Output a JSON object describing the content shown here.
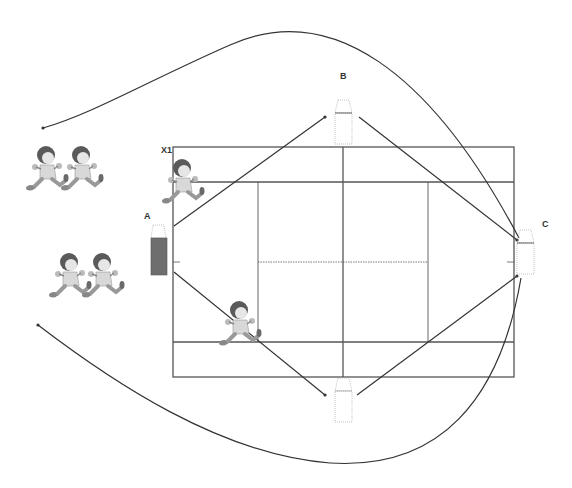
{
  "diagram": {
    "type": "badminton-court-drill",
    "labels": {
      "x1": "X1",
      "a": "A",
      "b": "B",
      "c": "C"
    },
    "colors": {
      "line": "#333333",
      "court_line": "#555555",
      "cone_outline": "#999999",
      "cone_fill_active": "#6e6e6e",
      "player_hair": "#555555",
      "player_body": "#cfcfcf"
    },
    "cones": [
      {
        "id": "A",
        "state": "filled"
      },
      {
        "id": "B",
        "state": "outline"
      },
      {
        "id": "C",
        "state": "outline"
      },
      {
        "id": "bottom",
        "state": "outline"
      }
    ],
    "players": [
      {
        "id": "X1",
        "position": "near cone A"
      },
      {
        "id": "runner",
        "position": "bottom-left court"
      },
      {
        "id": "queue-top-1",
        "position": "waiting queue top"
      },
      {
        "id": "queue-top-2",
        "position": "waiting queue top"
      },
      {
        "id": "queue-bottom-1",
        "position": "waiting queue bottom"
      },
      {
        "id": "queue-bottom-2",
        "position": "waiting queue bottom"
      }
    ]
  }
}
